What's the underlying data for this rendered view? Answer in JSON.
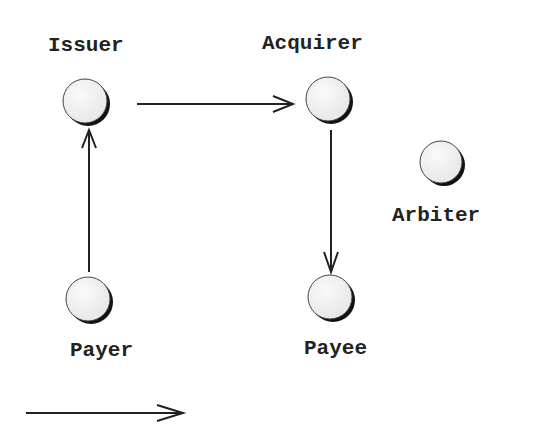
{
  "nodes": {
    "issuer": {
      "label": "Issuer"
    },
    "acquirer": {
      "label": "Acquirer"
    },
    "arbiter": {
      "label": "Arbiter"
    },
    "payer": {
      "label": "Payer"
    },
    "payee": {
      "label": "Payee"
    }
  },
  "edges": [
    {
      "from": "payer",
      "to": "issuer"
    },
    {
      "from": "issuer",
      "to": "acquirer"
    },
    {
      "from": "acquirer",
      "to": "payee"
    }
  ],
  "legend": {
    "arrow": "legend-arrow"
  },
  "colors": {
    "stroke": "#222222",
    "node_fill": "#f2f2f2",
    "shadow": "#111111"
  }
}
